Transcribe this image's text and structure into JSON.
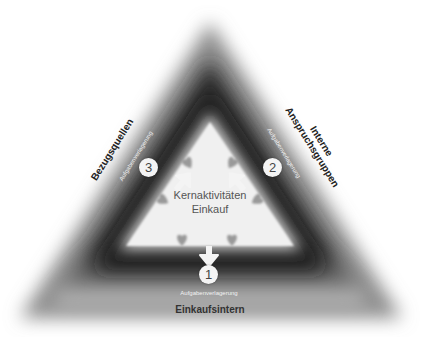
{
  "diagram": {
    "center": {
      "line1": "Kernaktivitäten",
      "line2": "Einkauf"
    },
    "nodes": [
      {
        "number": "1",
        "sub_label": "Aufgabenverlagerung",
        "label": "Einkaufsintern"
      },
      {
        "number": "2",
        "sub_label": "Aufgabenverlagerung",
        "label_line1": "Interne",
        "label_line2": "Anspruchsgruppen"
      },
      {
        "number": "3",
        "sub_label": "Aufgabenverlagerung",
        "label": "Bezugsquellen"
      }
    ],
    "icons": [
      "heart-icon",
      "arrow-icon",
      "number-badge"
    ],
    "colors": {
      "outer_dark": "#2b2b2b",
      "inner_light": "#f0f0f0",
      "badge": "#f4f4f4",
      "heart": "#8a8a8a"
    }
  }
}
